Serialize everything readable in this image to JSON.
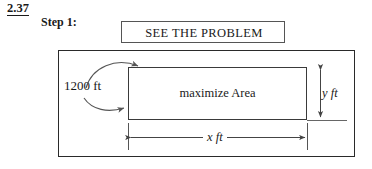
{
  "figure": {
    "problem_number": "2.37",
    "step_label": "Step 1:",
    "title": "SEE THE PROBLEM",
    "area_label": "maximize Area",
    "fence_length_label": "1200 ft",
    "height_dimension_label": "y ft",
    "width_dimension_label": "x ft",
    "colors": {
      "ink": "#1a1a1a",
      "outer_border": "#2a2a2a",
      "inner_border": "#3a3a3a",
      "title_border": "#555555",
      "background": "#ffffff",
      "dimension_line": "#444444"
    },
    "icons": {
      "curved_arrow_upper": "curved-arrow-up-right-icon",
      "curved_arrow_lower": "curved-arrow-down-right-icon",
      "vertical_dimension": "double-headed-vertical-arrow-icon",
      "horizontal_dimension": "double-headed-horizontal-arrow-icon"
    }
  }
}
